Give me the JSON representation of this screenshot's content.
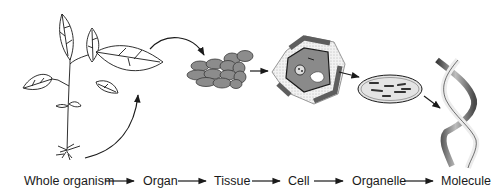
{
  "diagram": {
    "levels": [
      {
        "label": "Whole organism",
        "icon": "plant-icon"
      },
      {
        "label": "Organ",
        "icon": "leaf-icon"
      },
      {
        "label": "Tissue",
        "icon": "tissue-cells-icon"
      },
      {
        "label": "Cell",
        "icon": "plant-cell-icon"
      },
      {
        "label": "Organelle",
        "icon": "chloroplast-icon"
      },
      {
        "label": "Molecule",
        "icon": "dna-helix-icon"
      }
    ],
    "colors": {
      "line": "#1a1a1a",
      "cell_fill": "#8a8a8a",
      "cell_dark": "#5e5e5e",
      "cell_wall": "#e6e6e6",
      "organelle_fill": "#dcdcdc"
    }
  }
}
